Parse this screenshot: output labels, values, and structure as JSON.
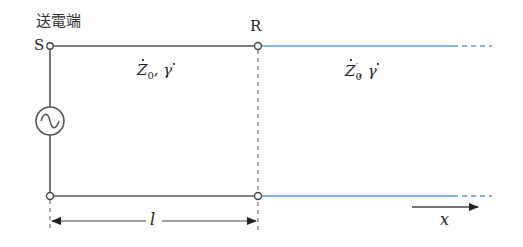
{
  "labels": {
    "sending_end": "送電端",
    "node_s": "S",
    "node_r": "R",
    "line1_params": "Ż₀, γ̇",
    "line1_z": "Z",
    "line1_z_sub": "0",
    "line1_gamma": "γ",
    "line2_z": "Z",
    "line2_z_sub": "0",
    "line2_prime": "′",
    "line2_gamma": "γ",
    "length_label": "l",
    "direction_label": "x"
  },
  "colors": {
    "line": "#555555",
    "line_ext": "#5b9bd5",
    "text": "#222222"
  },
  "icons": {
    "source": "ac-source-icon"
  }
}
